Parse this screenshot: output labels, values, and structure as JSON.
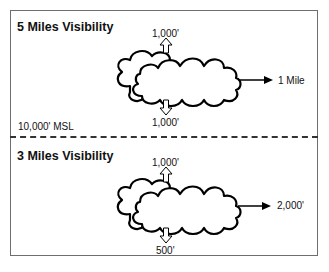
{
  "figure": {
    "panels": [
      {
        "title": "5 Miles Visibility",
        "above_clouds": "1,000'",
        "below_clouds": "1,000'",
        "horizontal": "1 Mile"
      },
      {
        "title": "3 Miles Visibility",
        "above_clouds": "1,000'",
        "below_clouds": "500'",
        "horizontal": "2,000'"
      }
    ],
    "divider_label": "10,000' MSL"
  }
}
